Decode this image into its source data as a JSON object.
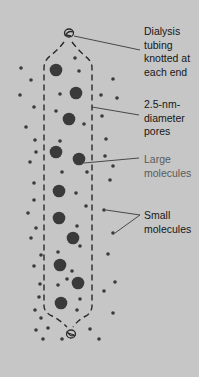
{
  "colors": {
    "background": "#c6c6c6",
    "bottom_strip": "#ffffff",
    "molecule": "#3a3a3a",
    "tubing": "#2a2a2a",
    "label_text": "#161616",
    "label_text_light": "#5a5a5a"
  },
  "labels": {
    "tubing": "Dialysis\ntubing\nknotted at\neach end",
    "pores": "2.5-nm-\ndiameter\npores",
    "large": "Large\nmolecules",
    "small": "Small\nmolecules"
  },
  "large_molecules": [
    [
      56,
      70
    ],
    [
      76,
      93
    ],
    [
      69,
      119
    ],
    [
      56,
      152
    ],
    [
      79,
      159
    ],
    [
      59,
      191
    ],
    [
      59,
      218
    ],
    [
      73,
      238
    ],
    [
      60,
      265
    ],
    [
      78,
      283
    ],
    [
      61,
      303
    ]
  ],
  "small_molecules_inside": [
    [
      75,
      58
    ],
    [
      79,
      71
    ],
    [
      60,
      94
    ],
    [
      56,
      111
    ],
    [
      84,
      124
    ],
    [
      60,
      141
    ],
    [
      62,
      172
    ],
    [
      87,
      172
    ],
    [
      76,
      193
    ],
    [
      86,
      206
    ],
    [
      77,
      226
    ],
    [
      58,
      252
    ],
    [
      80,
      246
    ],
    [
      72,
      271
    ],
    [
      58,
      285
    ],
    [
      80,
      299
    ],
    [
      77,
      310
    ],
    [
      67,
      279
    ]
  ],
  "small_molecules_outside": [
    [
      21,
      68
    ],
    [
      31,
      80
    ],
    [
      20,
      95
    ],
    [
      34,
      107
    ],
    [
      26,
      127
    ],
    [
      35,
      140
    ],
    [
      36,
      152
    ],
    [
      30,
      162
    ],
    [
      34,
      183
    ],
    [
      34,
      200
    ],
    [
      28,
      213
    ],
    [
      36,
      228
    ],
    [
      31,
      238
    ],
    [
      41,
      255
    ],
    [
      34,
      266
    ],
    [
      40,
      284
    ],
    [
      39,
      297
    ],
    [
      35,
      310
    ],
    [
      41,
      318
    ],
    [
      36,
      330
    ],
    [
      48,
      328
    ],
    [
      43,
      339
    ],
    [
      62,
      339
    ],
    [
      113,
      79
    ],
    [
      117,
      98
    ],
    [
      101,
      95
    ],
    [
      102,
      116
    ],
    [
      106,
      139
    ],
    [
      105,
      156
    ],
    [
      113,
      166
    ],
    [
      110,
      180
    ],
    [
      104,
      210
    ],
    [
      113,
      233
    ],
    [
      108,
      254
    ],
    [
      115,
      282
    ],
    [
      104,
      291
    ],
    [
      113,
      313
    ],
    [
      90,
      329
    ],
    [
      99,
      339
    ]
  ],
  "pointer_lines": {
    "tubing": [
      [
        74,
        36
      ],
      [
        140,
        50
      ]
    ],
    "pores": [
      [
        92,
        107
      ],
      [
        139,
        115
      ]
    ],
    "large": [
      [
        84,
        163
      ],
      [
        139,
        158
      ]
    ],
    "small_a": [
      [
        106,
        210
      ],
      [
        140,
        215
      ]
    ],
    "small_b": [
      [
        115,
        233
      ],
      [
        140,
        215
      ]
    ]
  }
}
